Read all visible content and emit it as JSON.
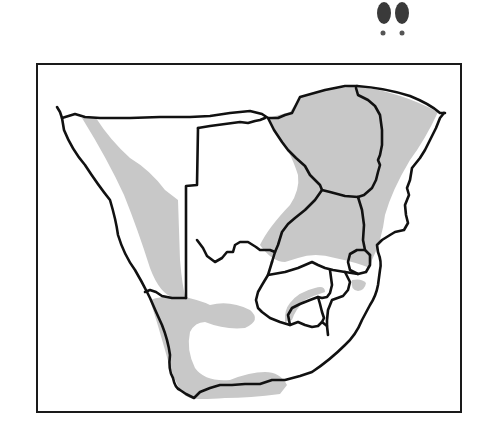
{
  "map": {
    "title": "Distribution range map — Southern Africa",
    "region": "Southern Africa",
    "legend": {
      "range_fill_color": "#c8c8c8",
      "border_color": "#111111",
      "background_color": "#ffffff"
    },
    "icon": {
      "name": "hoofprint-icon",
      "color": "#3a3a3a"
    }
  }
}
